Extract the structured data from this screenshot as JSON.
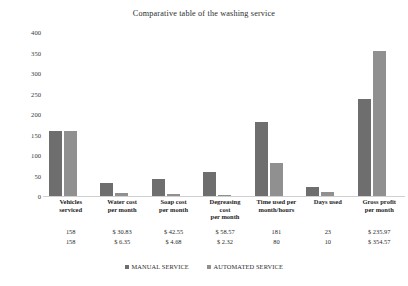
{
  "chart_data": {
    "type": "bar",
    "title": "Comparative table of the washing service",
    "xlabel": "",
    "ylabel": "",
    "ylim": [
      0,
      400
    ],
    "yticks": [
      0,
      50,
      100,
      150,
      200,
      250,
      300,
      350,
      400
    ],
    "grid": false,
    "legend_position": "bottom",
    "categories": [
      "Vehicles serviced",
      "Water cost per month",
      "Soap cost per month",
      "Degreasing cost per month",
      "Time used per month/hours",
      "Days used",
      "Gross profit per month"
    ],
    "series": [
      {
        "name": "MANUAL SERVICE",
        "color": "#6e6e6e",
        "values": [
          158,
          30.83,
          42.55,
          58.57,
          181,
          23,
          235.97
        ],
        "labels": [
          "158",
          "$ 30.83",
          "$ 42.55",
          "$ 58.57",
          "181",
          "23",
          "$ 235.97"
        ]
      },
      {
        "name": "AUTOMATED SERVICE",
        "color": "#909090",
        "values": [
          158,
          6.35,
          4.68,
          2.32,
          80,
          10,
          354.57
        ],
        "labels": [
          "158",
          "$ 6.35",
          "$ 4.68",
          "$ 2.32",
          "80",
          "10",
          "$ 354.57"
        ]
      }
    ]
  },
  "categories_wrapped": [
    [
      "Vehicles",
      "serviced"
    ],
    [
      "Water cost",
      "per month"
    ],
    [
      "Soap cost",
      "per month"
    ],
    [
      "Degreasing",
      "cost",
      "per month"
    ],
    [
      "Time used per",
      "month/hours"
    ],
    [
      "Days used"
    ],
    [
      "Gross profit",
      "per month"
    ]
  ]
}
